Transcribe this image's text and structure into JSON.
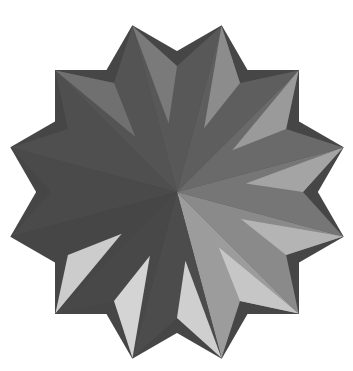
{
  "figure": {
    "background": "#ffffff",
    "center": [
      177,
      192
    ],
    "tip_radius": 172,
    "notch_radius": 126,
    "square_half_side": 122,
    "rotations_deg": [
      0,
      30,
      60
    ],
    "wedges": [
      {
        "from_deg": 165,
        "to_deg": 195,
        "fill": "#4a4a4a"
      },
      {
        "from_deg": 195,
        "to_deg": 225,
        "fill": "#4f4f4f"
      },
      {
        "from_deg": 225,
        "to_deg": 255,
        "fill": "#545454"
      },
      {
        "from_deg": 255,
        "to_deg": 285,
        "fill": "#585858"
      },
      {
        "from_deg": 285,
        "to_deg": 315,
        "fill": "#5e5e5e"
      },
      {
        "from_deg": 315,
        "to_deg": 345,
        "fill": "#6a6a6a"
      },
      {
        "from_deg": 345,
        "to_deg": 375,
        "fill": "#767676"
      },
      {
        "from_deg": 15,
        "to_deg": 45,
        "fill": "#8a8a8a"
      },
      {
        "from_deg": 45,
        "to_deg": 75,
        "fill": "#9c9c9c"
      },
      {
        "from_deg": 75,
        "to_deg": 105,
        "fill": "#4c4c4c"
      },
      {
        "from_deg": 105,
        "to_deg": 135,
        "fill": "#484848"
      },
      {
        "from_deg": 135,
        "to_deg": 165,
        "fill": "#464646"
      }
    ],
    "tip_facets": [
      {
        "tip_deg": 255,
        "fill": "#7a7a7a"
      },
      {
        "tip_deg": 285,
        "fill": "#8c8c8c"
      },
      {
        "tip_deg": 315,
        "fill": "#9a9a9a"
      },
      {
        "tip_deg": 345,
        "fill": "#a4a4a4"
      },
      {
        "tip_deg": 15,
        "fill": "#b4b4b4"
      },
      {
        "tip_deg": 45,
        "fill": "#c6c6c6"
      },
      {
        "tip_deg": 75,
        "fill": "#cfcfcf"
      },
      {
        "tip_deg": 105,
        "fill": "#d4d4d4"
      },
      {
        "tip_deg": 135,
        "fill": "#cccccc"
      },
      {
        "tip_deg": 225,
        "fill": "#707070"
      }
    ],
    "colors": {
      "darkest": "#464646",
      "lightest": "#d4d4d4"
    }
  }
}
